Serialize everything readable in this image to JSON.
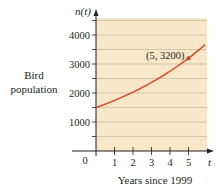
{
  "chart_data": {
    "type": "line",
    "title": "",
    "xlabel": "Years since 1999",
    "ylabel": "Bird population",
    "y_axis_var": "n(t)",
    "x_axis_var": "t",
    "x_ticks": [
      "0",
      "1",
      "2",
      "3",
      "4",
      "5"
    ],
    "y_ticks": [
      "1000",
      "2000",
      "3000",
      "4000"
    ],
    "xlim": [
      0,
      5.9
    ],
    "ylim": [
      0,
      4500
    ],
    "grid": true,
    "series": [
      {
        "name": "n(t)",
        "color": "#d9411e",
        "x": [
          0,
          1,
          2,
          3,
          4,
          5,
          5.9
        ],
        "values": [
          1500,
          1746,
          2032,
          2365,
          2750,
          3200,
          3660
        ]
      }
    ],
    "highlighted_point": {
      "x": 5,
      "y": 3200,
      "label": "(5, 3200)"
    },
    "background_color": "#f8e7c8",
    "gridline_color": "#b9ab97"
  },
  "labels": {
    "y_title_line1": "Bird",
    "y_title_line2": "population",
    "x_title": "Years since 1999",
    "origin": "0",
    "y_var": "n(t)",
    "x_var": "t",
    "point_annotation": "(5, 3200)"
  }
}
